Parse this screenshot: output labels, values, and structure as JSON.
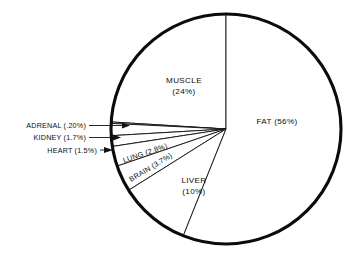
{
  "chart_data": {
    "type": "pie",
    "title": "",
    "subtitle": "",
    "xlabel": "",
    "ylabel": "",
    "legend_position": "none",
    "grid": false,
    "total_percent": 99.9,
    "start_angle_deg": 90,
    "direction": "counterclockwise",
    "categories": [
      "MUSCLE",
      "ADRENAL",
      "KIDNEY",
      "HEART",
      "LUNG",
      "BRAIN",
      "LIVER",
      "FAT"
    ],
    "values": [
      24,
      0.2,
      1.7,
      1.5,
      2.8,
      3.7,
      10,
      56
    ],
    "slices": [
      {
        "name": "MUSCLE",
        "label": "MUSCLE",
        "percent_label": "(24%)",
        "value": 24,
        "label_placement": "inside",
        "label_x": 184,
        "label_y": 83,
        "label_y2": 94
      },
      {
        "name": "ADRENAL",
        "label": "ADRENAL (.20%)",
        "percent_label": "(.20%)",
        "value": 0.2,
        "label_placement": "outside-left",
        "label_x": 86,
        "label_y": 128
      },
      {
        "name": "KIDNEY",
        "label": "KIDNEY (1.7%)",
        "percent_label": "(1.7%)",
        "value": 1.7,
        "label_placement": "outside-left",
        "label_x": 86,
        "label_y": 140
      },
      {
        "name": "HEART",
        "label": "HEART (1.5%)",
        "percent_label": "(1.5%)",
        "value": 1.5,
        "label_placement": "outside-left",
        "label_x": 97,
        "label_y": 153
      },
      {
        "name": "LUNG",
        "label": "LUNG (2.8%)",
        "percent_label": "(2.8%)",
        "value": 2.8,
        "label_placement": "inside-rotated",
        "label_x": 124,
        "label_y": 163,
        "rotation_deg": -19
      },
      {
        "name": "BRAIN",
        "label": "BRAIN (3.7%)",
        "percent_label": "(3.7%)",
        "value": 3.7,
        "label_placement": "inside-rotated",
        "label_x": 131,
        "label_y": 182,
        "rotation_deg": -31
      },
      {
        "name": "LIVER",
        "label": "LIVER",
        "percent_label": "(10%)",
        "value": 10,
        "label_placement": "inside",
        "label_x": 194,
        "label_y": 183,
        "label_y2": 194
      },
      {
        "name": "FAT",
        "label": "FAT (56%)",
        "percent_label": "(56%)",
        "value": 56,
        "label_placement": "inside",
        "label_x": 277,
        "label_y": 124
      }
    ],
    "colors": {
      "slice_fill": "#ffffff",
      "slice_stroke": "#111111",
      "outline": "#0b0b0b",
      "text": "#0d0d0d",
      "background": "#ffffff"
    },
    "geometry": {
      "center_x": 226,
      "center_y": 129,
      "radius": 115
    }
  },
  "labels": {
    "muscle_name": "MUSCLE",
    "muscle_pct": "(24%)",
    "fat_full": "FAT (56%)",
    "liver_name": "LIVER",
    "liver_pct": "(10%)",
    "adrenal_full": "ADRENAL (.20%)",
    "kidney_full": "KIDNEY (1.7%)",
    "heart_full": "HEART (1.5%)",
    "lung_full": "LUNG (2.8%)",
    "brain_full": "BRAIN (3.7%)"
  }
}
